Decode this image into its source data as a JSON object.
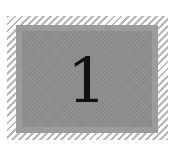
{
  "tile": {
    "numeral": "1",
    "colors": {
      "panel": "#8e8e8e",
      "hatch": "#b8b8b8",
      "text": "#111111",
      "background": "#ffffff"
    }
  }
}
